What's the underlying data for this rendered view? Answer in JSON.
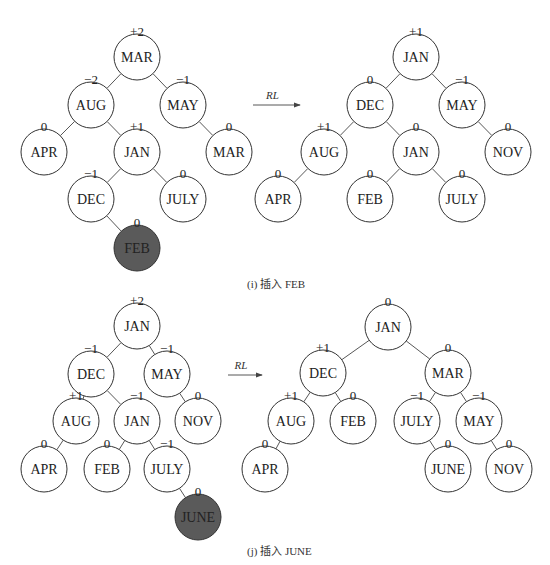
{
  "figures": [
    {
      "id": "i",
      "caption": "(i) 插入 FEB",
      "caption_pos": [
        247,
        282
      ],
      "arrow": {
        "label": "RL",
        "x1": 253,
        "x2": 300,
        "y": 105
      },
      "trees": [
        {
          "name": "before",
          "nodes": [
            {
              "key": "MAR",
              "bf": "+2",
              "x": 137,
              "y": 57
            },
            {
              "key": "AUG",
              "bf": "−2",
              "x": 91,
              "y": 105
            },
            {
              "key": "MAY",
              "bf": "−1",
              "x": 183,
              "y": 105
            },
            {
              "key": "APR",
              "bf": "0",
              "x": 44,
              "y": 152
            },
            {
              "key": "JAN",
              "bf": "+1",
              "x": 137,
              "y": 152
            },
            {
              "key": "MAR",
              "bf": "0",
              "x": 229,
              "y": 152
            },
            {
              "key": "DEC",
              "bf": "−1",
              "x": 91,
              "y": 199
            },
            {
              "key": "JULY",
              "bf": "0",
              "x": 183,
              "y": 199
            },
            {
              "key": "FEB",
              "bf": "0",
              "x": 137,
              "y": 248,
              "highlight": true
            }
          ],
          "edges": [
            [
              0,
              1
            ],
            [
              0,
              2
            ],
            [
              1,
              3
            ],
            [
              1,
              4
            ],
            [
              2,
              5
            ],
            [
              4,
              6
            ],
            [
              4,
              7
            ],
            [
              6,
              8
            ]
          ]
        },
        {
          "name": "after",
          "nodes": [
            {
              "key": "JAN",
              "bf": "+1",
              "x": 416,
              "y": 57
            },
            {
              "key": "DEC",
              "bf": "0",
              "x": 370,
              "y": 105
            },
            {
              "key": "MAY",
              "bf": "−1",
              "x": 462,
              "y": 105
            },
            {
              "key": "AUG",
              "bf": "+1",
              "x": 324,
              "y": 152
            },
            {
              "key": "JAN",
              "bf": "0",
              "x": 416,
              "y": 152
            },
            {
              "key": "NOV",
              "bf": "0",
              "x": 508,
              "y": 152
            },
            {
              "key": "APR",
              "bf": "0",
              "x": 278,
              "y": 199
            },
            {
              "key": "FEB",
              "bf": "0",
              "x": 370,
              "y": 199
            },
            {
              "key": "JULY",
              "bf": "0",
              "x": 462,
              "y": 199
            }
          ],
          "edges": [
            [
              0,
              1
            ],
            [
              0,
              2
            ],
            [
              1,
              3
            ],
            [
              1,
              4
            ],
            [
              2,
              5
            ],
            [
              3,
              6
            ],
            [
              4,
              7
            ],
            [
              4,
              8
            ]
          ]
        }
      ]
    },
    {
      "id": "j",
      "caption": "(j) 插入 JUNE",
      "caption_pos": [
        247,
        549
      ],
      "arrow": {
        "label": "RL",
        "x1": 228,
        "x2": 262,
        "y": 375
      },
      "trees": [
        {
          "name": "before",
          "nodes": [
            {
              "key": "JAN",
              "bf": "+2",
              "x": 137,
              "y": 326
            },
            {
              "key": "DEC",
              "bf": "−1",
              "x": 91,
              "y": 374
            },
            {
              "key": "MAY",
              "bf": "−1",
              "x": 167,
              "y": 374
            },
            {
              "key": "AUG",
              "bf": "+1",
              "x": 76,
              "y": 421
            },
            {
              "key": "JAN",
              "bf": "−1",
              "x": 137,
              "y": 421
            },
            {
              "key": "NOV",
              "bf": "0",
              "x": 198,
              "y": 421
            },
            {
              "key": "APR",
              "bf": "0",
              "x": 44,
              "y": 469
            },
            {
              "key": "FEB",
              "bf": "0",
              "x": 107,
              "y": 469
            },
            {
              "key": "JULY",
              "bf": "−1",
              "x": 167,
              "y": 469
            },
            {
              "key": "JUNE",
              "bf": "0",
              "x": 198,
              "y": 517,
              "highlight": true
            }
          ],
          "edges": [
            [
              0,
              1
            ],
            [
              0,
              2
            ],
            [
              1,
              3
            ],
            [
              1,
              4
            ],
            [
              2,
              5
            ],
            [
              3,
              6
            ],
            [
              4,
              7
            ],
            [
              4,
              8
            ],
            [
              8,
              9
            ]
          ]
        },
        {
          "name": "after",
          "nodes": [
            {
              "key": "JAN",
              "bf": "0",
              "x": 388,
              "y": 327
            },
            {
              "key": "DEC",
              "bf": "+1",
              "x": 323,
              "y": 373
            },
            {
              "key": "MAR",
              "bf": "0",
              "x": 448,
              "y": 373
            },
            {
              "key": "AUG",
              "bf": "+1",
              "x": 291,
              "y": 421
            },
            {
              "key": "FEB",
              "bf": "0",
              "x": 353,
              "y": 421
            },
            {
              "key": "JULY",
              "bf": "−1",
              "x": 417,
              "y": 421
            },
            {
              "key": "MAY",
              "bf": "−1",
              "x": 479,
              "y": 421
            },
            {
              "key": "APR",
              "bf": "0",
              "x": 265,
              "y": 469
            },
            {
              "key": "JUNE",
              "bf": "0",
              "x": 448,
              "y": 469
            },
            {
              "key": "NOV",
              "bf": "0",
              "x": 509,
              "y": 469
            }
          ],
          "edges": [
            [
              0,
              1
            ],
            [
              0,
              2
            ],
            [
              1,
              3
            ],
            [
              1,
              4
            ],
            [
              2,
              5
            ],
            [
              2,
              6
            ],
            [
              3,
              7
            ],
            [
              5,
              8
            ],
            [
              6,
              9
            ]
          ]
        }
      ]
    }
  ],
  "style": {
    "node_radius": 23,
    "highlight_fill": "#5a5a5a",
    "stroke": "#333333"
  }
}
